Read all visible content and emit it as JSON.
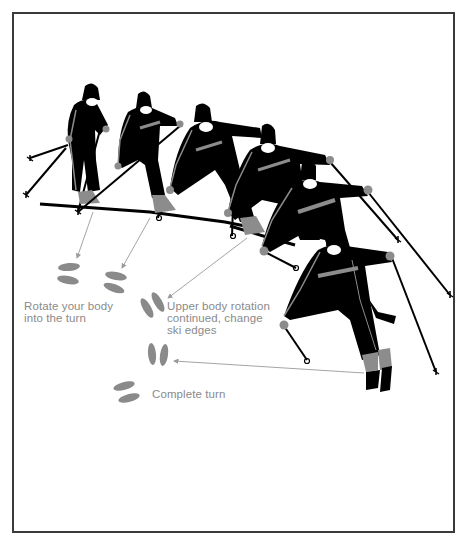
{
  "figure": {
    "colors": {
      "frame": "#3a3a3a",
      "suit": "#000000",
      "accent_gray": "#8c8c8c",
      "footprint": "#8a8a8a",
      "callout_line": "#9a9a9a",
      "label_text": "#8a8a8a",
      "background": "#ffffff"
    },
    "labels": {
      "step1": "Rotate your body\ninto the turn",
      "step2": "Upper body rotation\ncontinued, change\nski edges",
      "step3": "Complete turn"
    },
    "skier_count": 6,
    "footprint_pair_count": 5
  }
}
